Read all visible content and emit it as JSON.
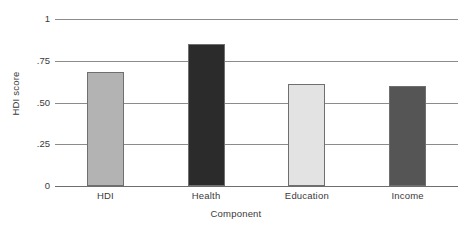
{
  "chart_data": {
    "type": "bar",
    "title": "",
    "subtitle": "",
    "xlabel": "Component",
    "ylabel": "HDI score",
    "categories": [
      "HDI",
      "Health",
      "Education",
      "Income"
    ],
    "values": [
      0.68,
      0.85,
      0.61,
      0.6
    ],
    "series": [
      {
        "name": "HDI score",
        "values": [
          0.68,
          0.85,
          0.61,
          0.6
        ]
      }
    ],
    "bar_colors": [
      "#b3b3b3",
      "#2b2b2b",
      "#e3e3e3",
      "#555555"
    ],
    "bar_border_color": "#6f6f6f",
    "ylim": [
      0,
      1
    ],
    "yticks": [
      0,
      0.25,
      0.5,
      0.75,
      1
    ],
    "ytick_labels": [
      "0",
      ".25",
      ".50",
      ".75",
      "1"
    ],
    "grid": true,
    "grid_axis": "y",
    "grid_color": "#8c8c8c",
    "legend": false,
    "legend_position": "none",
    "background_color": "#ffffff",
    "text_color": "#3a3a3a",
    "annotations": []
  },
  "axes": {
    "y_title": "HDI score",
    "x_title": "Component"
  },
  "y_ticks": [
    {
      "label": "1",
      "value": 1
    },
    {
      "label": ".75",
      "value": 0.75
    },
    {
      "label": ".50",
      "value": 0.5
    },
    {
      "label": ".25",
      "value": 0.25
    },
    {
      "label": "0",
      "value": 0
    }
  ],
  "bars": [
    {
      "label": "HDI",
      "value": 0.68,
      "color": "#b3b3b3"
    },
    {
      "label": "Health",
      "value": 0.85,
      "color": "#2b2b2b"
    },
    {
      "label": "Education",
      "value": 0.61,
      "color": "#e3e3e3"
    },
    {
      "label": "Income",
      "value": 0.6,
      "color": "#555555"
    }
  ]
}
